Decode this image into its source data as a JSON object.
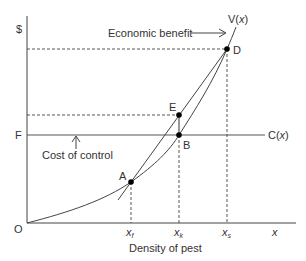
{
  "diagram": {
    "y_axis_label": "$",
    "origin_label": "O",
    "x_axis_end_label": "x",
    "x_axis_title": "Density of pest",
    "level_label": "F",
    "curves": {
      "benefit": {
        "label_prefix": "V(",
        "label_var": "x",
        "label_suffix": ")"
      },
      "cost": {
        "label_prefix": "C(",
        "label_var": "x",
        "label_suffix": ")"
      }
    },
    "annotations": {
      "economic_benefit": "Economic benefit",
      "cost_of_control": "Cost of control"
    },
    "points": [
      {
        "id": "A",
        "label": "A"
      },
      {
        "id": "B",
        "label": "B"
      },
      {
        "id": "D",
        "label": "D"
      },
      {
        "id": "E",
        "label": "E"
      }
    ],
    "x_ticks": [
      {
        "var": "x",
        "sub": "f"
      },
      {
        "var": "x",
        "sub": "k"
      },
      {
        "var": "x",
        "sub": "s"
      }
    ]
  }
}
